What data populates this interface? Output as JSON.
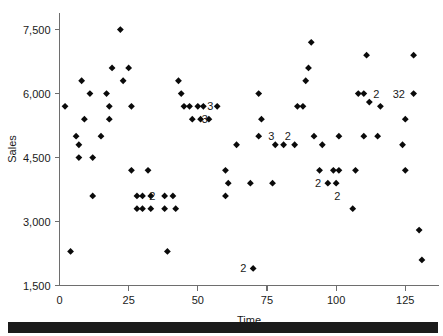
{
  "figure": {
    "background_color": "#ffffff",
    "marker_color": "#000000",
    "axis_color": "#6e6e6e",
    "bottom_band_color": "#1b1b1b"
  },
  "chart_data": {
    "type": "scatter",
    "title": "",
    "xlabel": "Time",
    "ylabel": "Sales",
    "xlim": [
      0,
      137
    ],
    "ylim": [
      1500,
      7900
    ],
    "xticks": [
      0,
      25,
      50,
      75,
      100,
      125
    ],
    "xtick_labels": [
      "0",
      "25",
      "50",
      "75",
      "100",
      "125"
    ],
    "yticks": [
      1500,
      3000,
      4500,
      6000,
      7500
    ],
    "ytick_labels": [
      "1,500",
      "3,000",
      "4,500",
      "6,000",
      "7,500"
    ],
    "grid": false,
    "legend": null,
    "marker_style": "diamond",
    "points": [
      {
        "x": 2,
        "y": 5700
      },
      {
        "x": 4,
        "y": 2300
      },
      {
        "x": 6,
        "y": 5000
      },
      {
        "x": 7,
        "y": 4800
      },
      {
        "x": 7,
        "y": 4500
      },
      {
        "x": 8,
        "y": 6300
      },
      {
        "x": 9,
        "y": 5400
      },
      {
        "x": 11,
        "y": 6000
      },
      {
        "x": 12,
        "y": 4500
      },
      {
        "x": 12,
        "y": 3600
      },
      {
        "x": 15,
        "y": 5000
      },
      {
        "x": 17,
        "y": 6000
      },
      {
        "x": 18,
        "y": 5700
      },
      {
        "x": 18,
        "y": 5400
      },
      {
        "x": 19,
        "y": 6600
      },
      {
        "x": 22,
        "y": 7500
      },
      {
        "x": 23,
        "y": 6300
      },
      {
        "x": 25,
        "y": 6600
      },
      {
        "x": 26,
        "y": 5700
      },
      {
        "x": 26,
        "y": 4200
      },
      {
        "x": 28,
        "y": 3600
      },
      {
        "x": 28,
        "y": 3300
      },
      {
        "x": 30,
        "y": 3600
      },
      {
        "x": 30,
        "y": 3300
      },
      {
        "x": 32,
        "y": 4200
      },
      {
        "x": 33,
        "y": 3600
      },
      {
        "x": 33,
        "y": 3300
      },
      {
        "x": 38,
        "y": 3600
      },
      {
        "x": 38,
        "y": 3300
      },
      {
        "x": 39,
        "y": 2300
      },
      {
        "x": 41,
        "y": 3600
      },
      {
        "x": 42,
        "y": 3300
      },
      {
        "x": 43,
        "y": 6300
      },
      {
        "x": 44,
        "y": 6000
      },
      {
        "x": 45,
        "y": 5700
      },
      {
        "x": 47,
        "y": 5700
      },
      {
        "x": 48,
        "y": 5400
      },
      {
        "x": 50,
        "y": 5700
      },
      {
        "x": 51,
        "y": 5400
      },
      {
        "x": 52,
        "y": 5700
      },
      {
        "x": 54,
        "y": 5400
      },
      {
        "x": 57,
        "y": 5700
      },
      {
        "x": 60,
        "y": 4200
      },
      {
        "x": 60,
        "y": 3600
      },
      {
        "x": 61,
        "y": 3900
      },
      {
        "x": 64,
        "y": 4800
      },
      {
        "x": 69,
        "y": 3900
      },
      {
        "x": 70,
        "y": 1900
      },
      {
        "x": 72,
        "y": 6000
      },
      {
        "x": 72,
        "y": 5000
      },
      {
        "x": 73,
        "y": 5400
      },
      {
        "x": 77,
        "y": 3900
      },
      {
        "x": 78,
        "y": 4800
      },
      {
        "x": 81,
        "y": 4800
      },
      {
        "x": 85,
        "y": 4800
      },
      {
        "x": 86,
        "y": 5700
      },
      {
        "x": 88,
        "y": 5700
      },
      {
        "x": 89,
        "y": 6300
      },
      {
        "x": 90,
        "y": 6600
      },
      {
        "x": 91,
        "y": 7200
      },
      {
        "x": 92,
        "y": 5000
      },
      {
        "x": 94,
        "y": 4200
      },
      {
        "x": 95,
        "y": 4800
      },
      {
        "x": 97,
        "y": 3900
      },
      {
        "x": 99,
        "y": 4200
      },
      {
        "x": 100,
        "y": 3900
      },
      {
        "x": 101,
        "y": 4200
      },
      {
        "x": 101,
        "y": 5000
      },
      {
        "x": 106,
        "y": 3300
      },
      {
        "x": 107,
        "y": 4200
      },
      {
        "x": 108,
        "y": 6000
      },
      {
        "x": 110,
        "y": 6000
      },
      {
        "x": 110,
        "y": 5000
      },
      {
        "x": 111,
        "y": 6900
      },
      {
        "x": 112,
        "y": 5800
      },
      {
        "x": 115,
        "y": 5000
      },
      {
        "x": 116,
        "y": 5700
      },
      {
        "x": 124,
        "y": 4800
      },
      {
        "x": 125,
        "y": 4200
      },
      {
        "x": 125,
        "y": 5400
      },
      {
        "x": 128,
        "y": 6000
      },
      {
        "x": 128,
        "y": 6900
      },
      {
        "x": 130,
        "y": 2800
      },
      {
        "x": 131,
        "y": 2100
      }
    ],
    "count_annotations": [
      {
        "x": 31,
        "y": 3600,
        "text": "2",
        "side": "right"
      },
      {
        "x": 52,
        "y": 5700,
        "text": "3",
        "side": "right"
      },
      {
        "x": 50,
        "y": 5400,
        "text": "3",
        "side": "right"
      },
      {
        "x": 69,
        "y": 1900,
        "text": "2",
        "side": "left"
      },
      {
        "x": 74,
        "y": 5000,
        "text": "3",
        "side": "right"
      },
      {
        "x": 80,
        "y": 5000,
        "text": "2",
        "side": "right"
      },
      {
        "x": 96,
        "y": 3900,
        "text": "2",
        "side": "left"
      },
      {
        "x": 103,
        "y": 3600,
        "text": "2",
        "side": "left"
      },
      {
        "x": 112,
        "y": 6000,
        "text": "2",
        "side": "right"
      },
      {
        "x": 119,
        "y": 6000,
        "text": "32",
        "side": "right"
      }
    ]
  }
}
